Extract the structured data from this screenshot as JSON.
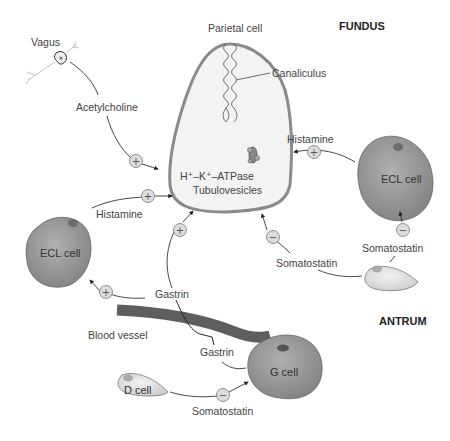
{
  "regions": {
    "fundus": "FUNDUS",
    "antrum": "ANTRUM"
  },
  "cells": {
    "parietal": {
      "label": "Parietal cell",
      "canaliculus": "Canaliculus",
      "pump_line1": "H⁺–K⁺–ATPase",
      "pump_line2": "Tubulovesicles"
    },
    "ecl_fundus": {
      "label": "ECL cell"
    },
    "ecl_antrum": {
      "label": "ECL cell"
    },
    "g_cell": {
      "label": "G cell"
    },
    "d_cell": {
      "label": "D cell"
    },
    "vagus": {
      "label": "Vagus"
    }
  },
  "structures": {
    "blood_vessel": "Blood vessel"
  },
  "signals": [
    {
      "id": "acetylcholine",
      "label": "Acetylcholine",
      "sign": "+",
      "from": "Vagus",
      "to": "Parietal cell"
    },
    {
      "id": "histamine_left",
      "label": "Histamine",
      "sign": "+",
      "from": "ECL cell (left)",
      "to": "Parietal cell"
    },
    {
      "id": "histamine_right",
      "label": "Histamine",
      "sign": "+",
      "from": "ECL cell (right)",
      "to": "Parietal cell"
    },
    {
      "id": "gastrin_parietal",
      "label": "Gastrin",
      "sign": "+",
      "from": "G cell",
      "to": "Parietal cell"
    },
    {
      "id": "gastrin_ecl",
      "label": "Gastrin",
      "sign": "+",
      "from": "G cell",
      "to": "ECL cell (left)"
    },
    {
      "id": "gastrin_g",
      "label": "Gastrin",
      "sign": "",
      "from": "G cell",
      "to": "Blood vessel"
    },
    {
      "id": "somatostatin_parietal",
      "label": "Somatostatin",
      "sign": "−",
      "from": "D cell (fundus)",
      "to": "Parietal cell"
    },
    {
      "id": "somatostatin_ecl",
      "label": "Somatostatin",
      "sign": "−",
      "from": "D cell (fundus)",
      "to": "ECL cell (right)"
    },
    {
      "id": "somatostatin_gcell",
      "label": "Somatostatin",
      "sign": "−",
      "from": "D cell (antrum)",
      "to": "G cell"
    }
  ],
  "signs": {
    "plus": "+",
    "minus": "−"
  },
  "colors": {
    "cell_fill_dark": "#8f8f8f",
    "cell_fill_light": "#d8d8d8",
    "parietal_fill": "#f2f2f2",
    "parietal_stroke": "#8a8a8a",
    "vessel": "#5e5e5e",
    "sign_fill": "#dcdcdc"
  }
}
